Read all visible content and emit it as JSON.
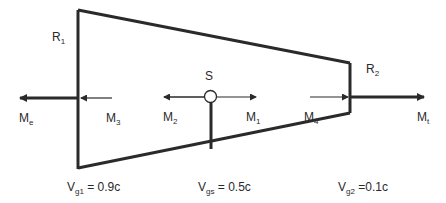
{
  "diagram": {
    "labels": {
      "R1": {
        "base": "R",
        "sub": "1"
      },
      "R2": {
        "base": "R",
        "sub": "2"
      },
      "S": {
        "base": "S",
        "sub": ""
      },
      "Me": {
        "base": "M",
        "sub": "e"
      },
      "M3": {
        "base": "M",
        "sub": "3"
      },
      "M2": {
        "base": "M",
        "sub": "2"
      },
      "M1": {
        "base": "M",
        "sub": "1"
      },
      "M4": {
        "base": "M",
        "sub": "4"
      },
      "Mt": {
        "base": "M",
        "sub": "t"
      },
      "Vg1": {
        "base": "V",
        "sub": "g1",
        "rest": " = 0.9c"
      },
      "Vgs": {
        "base": "V",
        "sub": "gs",
        "rest": " = 0.5c"
      },
      "Vg2": {
        "base": "V",
        "sub": "g2",
        "rest": " =0.1c"
      }
    },
    "colors": {
      "stroke": "#2a2a2a",
      "background": "#ffffff"
    }
  }
}
